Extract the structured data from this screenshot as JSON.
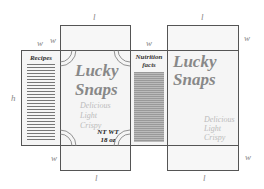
{
  "diagram": {
    "type": "cereal-box-net",
    "dimension_labels": {
      "top_front_length": "l",
      "top_back_length": "l",
      "left_width_outer": "w",
      "left_width_inner": "w",
      "nutrition_width": "w",
      "right_width": "w",
      "height": "h",
      "bottom_width": "w",
      "bottom_front_length": "l",
      "bottom_back_length": "l",
      "bottom_right_width": "w"
    },
    "panels": {
      "recipes": {
        "title": "Recipes"
      },
      "front": {
        "brand_line1": "Lucky",
        "brand_line2": "Snaps",
        "tagline": [
          "Delicious",
          "Light",
          "Crispy"
        ],
        "net_weight_line1": "NT WT",
        "net_weight_line2": "18 oz"
      },
      "nutrition": {
        "title_line1": "Nutrition",
        "title_line2": "facts"
      },
      "back": {
        "brand_line1": "Lucky",
        "brand_line2": "Snaps",
        "tagline": [
          "Delicious",
          "Light",
          "Crispy"
        ]
      }
    },
    "colors": {
      "outline": "#555555",
      "panel_fill": "#f5f5f5",
      "brand_text": "#888888",
      "tagline_text": "#bbbbbb",
      "dimension_text": "#888888"
    }
  }
}
